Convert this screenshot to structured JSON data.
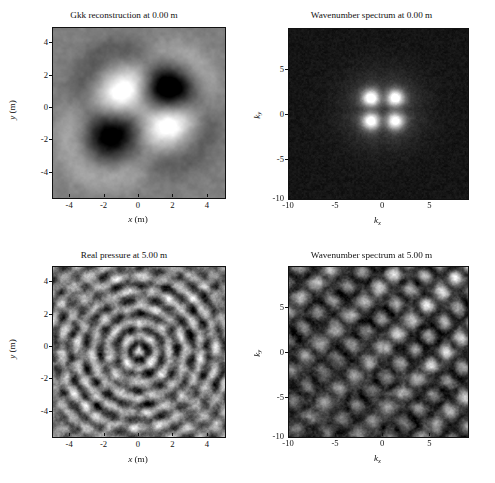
{
  "figure": {
    "background": "#ffffff",
    "colormap": "gray",
    "panel_count": 4
  },
  "panels": [
    {
      "id": "gkk-reconstruction",
      "title": "Gkk reconstruction at 0.00 m",
      "xlabel_main": "x",
      "xlabel_unit": " (m)",
      "ylabel_main": "y",
      "ylabel_unit": " (m)",
      "xticks": [
        "-4",
        "-2",
        "0",
        "2",
        "4"
      ],
      "yticks": [
        "4",
        "2",
        "0",
        "-2",
        "-4"
      ],
      "bg_level": "#808080"
    },
    {
      "id": "wavenumber-spectrum-0",
      "title": "Wavenumber spectrum at 0.00 m",
      "xlabel_main": "k",
      "xlabel_sub": "x",
      "ylabel_main": "k",
      "ylabel_sub": "y",
      "xticks": [
        "-10",
        "-5",
        "0",
        "5"
      ],
      "yticks": [
        "5",
        "0",
        "-5",
        "-10"
      ],
      "bg_level": "#0d0d0d"
    },
    {
      "id": "real-pressure",
      "title": "Real pressure at 5.00 m",
      "xlabel_main": "x",
      "xlabel_unit": " (m)",
      "ylabel_main": "y",
      "ylabel_unit": " (m)",
      "xticks": [
        "-4",
        "-2",
        "0",
        "2",
        "4"
      ],
      "yticks": [
        "4",
        "2",
        "0",
        "-2",
        "-4"
      ],
      "bg_level": "#7a7a7a"
    },
    {
      "id": "wavenumber-spectrum-5",
      "title": "Wavenumber spectrum at 5.00 m",
      "xlabel_main": "k",
      "xlabel_sub": "x",
      "ylabel_main": "k",
      "ylabel_sub": "y",
      "xticks": [
        "-10",
        "-5",
        "0",
        "5"
      ],
      "yticks": [
        "5",
        "0",
        "-5",
        "-10"
      ],
      "bg_level": "#3a3a3a"
    }
  ],
  "chart_data": [
    {
      "type": "heatmap",
      "title": "Gkk reconstruction at 0.00 m",
      "xlabel": "x (m)",
      "ylabel": "y (m)",
      "xlim": [
        -5.0,
        5.0
      ],
      "ylim": [
        -5.0,
        5.0
      ],
      "xticks": [
        -4,
        -2,
        0,
        2,
        4
      ],
      "yticks": [
        -4,
        -2,
        0,
        2,
        4
      ],
      "grid": false,
      "colormap": "gray",
      "description": "Smooth background at mid-gray with four localized lobes arranged around the origin: bright lobe near (-1.0, 1.4), dark lobe near (1.8, 1.5), dark lobe near (-1.8, -1.6), bright lobe near (1.7, -0.8).",
      "features": [
        {
          "cx": -1.0,
          "cy": 1.4,
          "radius": 1.2,
          "polarity": "bright",
          "peak": 1.0
        },
        {
          "cx": 1.9,
          "cy": 1.5,
          "radius": 1.1,
          "polarity": "dark",
          "peak": -0.95
        },
        {
          "cx": -1.8,
          "cy": -1.6,
          "radius": 1.2,
          "polarity": "dark",
          "peak": -1.0
        },
        {
          "cx": 1.7,
          "cy": -0.8,
          "radius": 1.2,
          "polarity": "bright",
          "peak": 0.95
        }
      ]
    },
    {
      "type": "heatmap",
      "title": "Wavenumber spectrum at 0.00 m",
      "xlabel": "kx",
      "ylabel": "ky",
      "xlim": [
        -10.0,
        9.0
      ],
      "ylim": [
        -10.0,
        9.0
      ],
      "xticks": [
        -10,
        -5,
        0,
        5
      ],
      "yticks": [
        -10,
        -5,
        0,
        5
      ],
      "grid": false,
      "colormap": "gray",
      "description": "Near-black background with a compact bright four-lobed cluster centered at the origin, spanning roughly |k| < 4.",
      "features": [
        {
          "cx": -1.3,
          "cy": 1.3,
          "radius": 1.1,
          "polarity": "bright",
          "peak": 1.0
        },
        {
          "cx": 1.3,
          "cy": 1.3,
          "radius": 1.1,
          "polarity": "bright",
          "peak": 0.95
        },
        {
          "cx": -1.3,
          "cy": -1.3,
          "radius": 1.1,
          "polarity": "bright",
          "peak": 0.95
        },
        {
          "cx": 1.3,
          "cy": -1.3,
          "radius": 1.1,
          "polarity": "bright",
          "peak": 0.9
        },
        {
          "cx": 0.0,
          "cy": 0.0,
          "radius": 3.6,
          "polarity": "halo",
          "peak": 0.3
        }
      ]
    },
    {
      "type": "heatmap",
      "title": "Real pressure at 5.00 m",
      "xlabel": "x (m)",
      "ylabel": "y (m)",
      "xlim": [
        -5.0,
        5.0
      ],
      "ylim": [
        -5.0,
        5.0
      ],
      "xticks": [
        -4,
        -2,
        0,
        2,
        4
      ],
      "yticks": [
        -4,
        -2,
        0,
        2,
        4
      ],
      "grid": false,
      "colormap": "gray",
      "description": "Speckled oscillatory interference field filling the whole square: concentric ring-like wavefronts modulated by fine-scale granular noise, brighter mottling in the central region near (0.5, 0).",
      "pattern": "concentric-ripples-with-speckle",
      "ripple_wavelength": 0.9,
      "speckle_scale": 0.35
    },
    {
      "type": "heatmap",
      "title": "Wavenumber spectrum at 5.00 m",
      "xlabel": "kx",
      "ylabel": "ky",
      "xlim": [
        -10.0,
        9.0
      ],
      "ylim": [
        -10.0,
        9.0
      ],
      "xticks": [
        -10,
        -5,
        0,
        5
      ],
      "yticks": [
        -10,
        -5,
        0,
        5
      ],
      "grid": false,
      "colormap": "gray",
      "description": "Dark field covered with a quasi-periodic lattice of bright blobs oriented along diagonal stripes running lower-left to upper-right, darker towards the lower-left corner.",
      "pattern": "diagonal-blob-lattice",
      "lattice_spacing": 2.2,
      "orientation_deg": 45
    }
  ]
}
